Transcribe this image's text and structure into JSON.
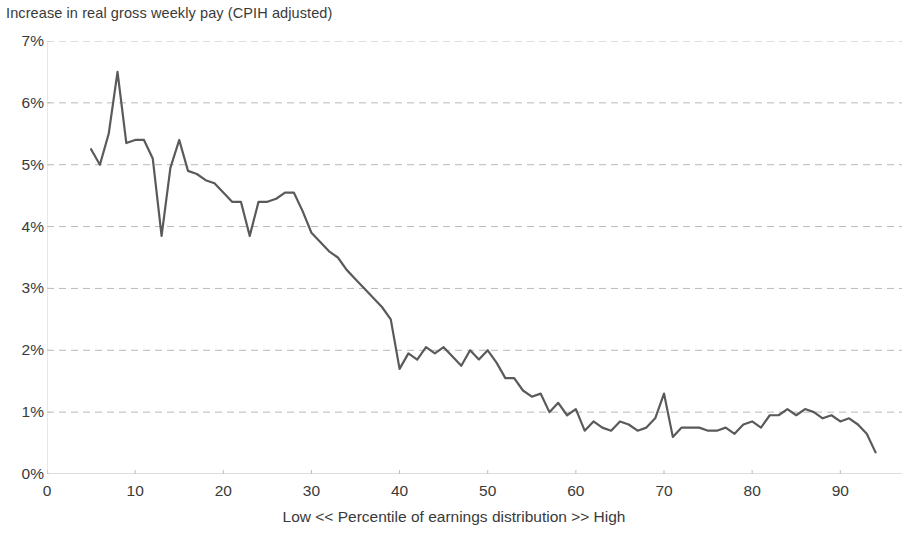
{
  "chart_data": {
    "type": "line",
    "title": "Increase in real gross weekly pay (CPIH adjusted)",
    "xlabel": "Low << Percentile of earnings distribution >> High",
    "ylabel": "",
    "xlim": [
      0,
      97
    ],
    "ylim": [
      0,
      7
    ],
    "grid": true,
    "grid_axis": "y",
    "legend": false,
    "line_color": "#5a5a5a",
    "y_ticks": [
      0,
      1,
      2,
      3,
      4,
      5,
      6,
      7
    ],
    "y_tick_labels": [
      "0%",
      "1%",
      "2%",
      "3%",
      "4%",
      "5%",
      "6%",
      "7%"
    ],
    "x_ticks": [
      0,
      10,
      20,
      30,
      40,
      50,
      60,
      70,
      80,
      90
    ],
    "x_tick_labels": [
      "0",
      "10",
      "20",
      "30",
      "40",
      "50",
      "60",
      "70",
      "80",
      "90"
    ],
    "series": [
      {
        "name": "Increase in real gross weekly pay (CPIH adjusted)",
        "x": [
          5,
          6,
          7,
          8,
          9,
          10,
          11,
          12,
          13,
          14,
          15,
          16,
          17,
          18,
          19,
          20,
          21,
          22,
          23,
          24,
          25,
          26,
          27,
          28,
          29,
          30,
          31,
          32,
          33,
          34,
          35,
          36,
          37,
          38,
          39,
          40,
          41,
          42,
          43,
          44,
          45,
          46,
          47,
          48,
          49,
          50,
          51,
          52,
          53,
          54,
          55,
          56,
          57,
          58,
          59,
          60,
          61,
          62,
          63,
          64,
          65,
          66,
          67,
          68,
          69,
          70,
          71,
          72,
          73,
          74,
          75,
          76,
          77,
          78,
          79,
          80,
          81,
          82,
          83,
          84,
          85,
          86,
          87,
          88,
          89,
          90,
          91,
          92,
          93,
          94
        ],
        "values": [
          5.25,
          5.0,
          5.5,
          6.5,
          5.35,
          5.4,
          5.4,
          5.1,
          3.85,
          4.95,
          5.4,
          4.9,
          4.85,
          4.75,
          4.7,
          4.55,
          4.4,
          4.4,
          3.85,
          4.4,
          4.4,
          4.45,
          4.55,
          4.55,
          4.25,
          3.9,
          3.75,
          3.6,
          3.5,
          3.3,
          3.15,
          3.0,
          2.85,
          2.7,
          2.5,
          1.7,
          1.95,
          1.85,
          2.05,
          1.95,
          2.05,
          1.9,
          1.75,
          2.0,
          1.85,
          2.0,
          1.8,
          1.55,
          1.55,
          1.35,
          1.25,
          1.3,
          1.0,
          1.15,
          0.95,
          1.05,
          0.7,
          0.85,
          0.75,
          0.7,
          0.85,
          0.8,
          0.7,
          0.75,
          0.9,
          1.3,
          0.6,
          0.75,
          0.75,
          0.75,
          0.7,
          0.7,
          0.75,
          0.65,
          0.8,
          0.85,
          0.75,
          0.95,
          0.95,
          1.05,
          0.95,
          1.05,
          1.0,
          0.9,
          0.95,
          0.85,
          0.9,
          0.8,
          0.65,
          0.35
        ]
      }
    ]
  }
}
